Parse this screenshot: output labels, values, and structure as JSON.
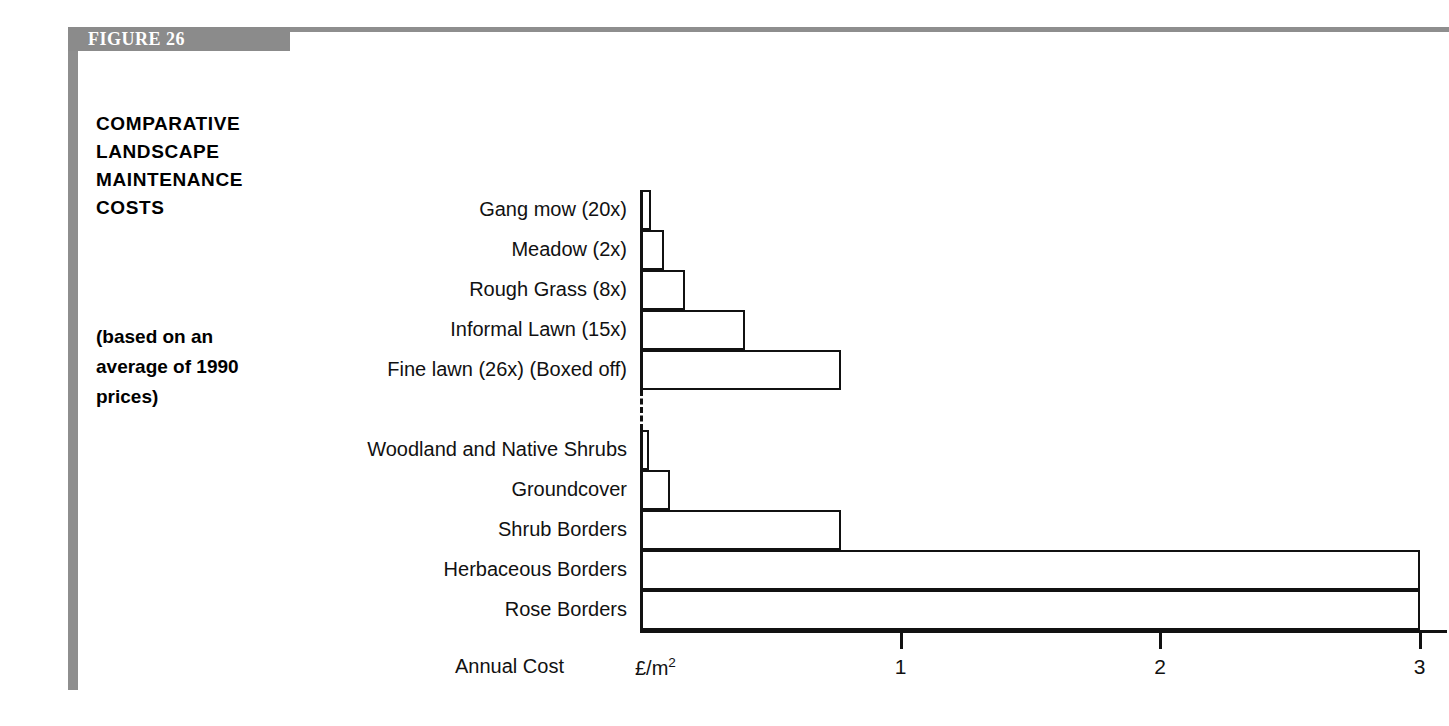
{
  "figure": {
    "banner_label": "FIGURE 26",
    "accent_gray": "#8e8e8e",
    "ink": "#111111"
  },
  "title": {
    "lines": [
      "COMPARATIVE",
      "LANDSCAPE",
      "MAINTENANCE",
      "COSTS"
    ]
  },
  "subtitle": {
    "lines": [
      "(based on an",
      "average of 1990",
      "prices)"
    ]
  },
  "chart_data": {
    "type": "bar",
    "orientation": "horizontal",
    "title": "COMPARATIVE LANDSCAPE MAINTENANCE COSTS",
    "subtitle": "(based on an average of 1990 prices)",
    "xlabel": "Annual Cost",
    "xunit": "£/m²",
    "ylabel": "",
    "xlim": [
      0,
      3
    ],
    "xticks": [
      1,
      2,
      3
    ],
    "xticklabels": [
      "1",
      "2",
      "3"
    ],
    "grid": false,
    "legend": false,
    "groups": [
      {
        "name": "Grass / mown surfaces",
        "categories": [
          "Gang mow (20x)",
          "Meadow (2x)",
          "Rough Grass (8x)",
          "Informal Lawn (15x)",
          "Fine lawn (26x)  (Boxed off)"
        ],
        "values": [
          0.04,
          0.09,
          0.17,
          0.4,
          0.77
        ]
      },
      {
        "name": "Planted areas",
        "categories": [
          "Woodland and  Native Shrubs",
          "Groundcover",
          "Shrub Borders",
          "Herbaceous Borders",
          "Rose Borders"
        ],
        "values": [
          0.03,
          0.11,
          0.77,
          3.0,
          3.0
        ]
      }
    ]
  }
}
